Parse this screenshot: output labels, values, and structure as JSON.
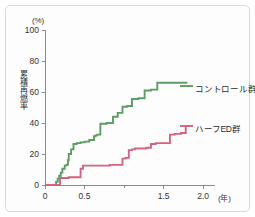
{
  "chart_data": {
    "type": "line",
    "title": "",
    "subtitle": "",
    "xlabel": "(年)",
    "ylabel": "累積再燃率",
    "yunit": "(%)",
    "xlim": [
      0,
      2.15
    ],
    "ylim": [
      0,
      100
    ],
    "grid": false,
    "step_style": "step-after",
    "legend_position": "right-inline",
    "x_ticks": [
      {
        "value": 0,
        "label": "0"
      },
      {
        "value": 0.5,
        "label": "0.5"
      },
      {
        "value": 1.0,
        "label": ""
      },
      {
        "value": 1.5,
        "label": "1.5"
      },
      {
        "value": 2.0,
        "label": "2.0"
      }
    ],
    "y_ticks": [
      {
        "value": 0,
        "label": "0"
      },
      {
        "value": 20,
        "label": "20"
      },
      {
        "value": 40,
        "label": "40"
      },
      {
        "value": 60,
        "label": "60"
      },
      {
        "value": 80,
        "label": "80"
      },
      {
        "value": 100,
        "label": "100"
      }
    ],
    "series": [
      {
        "name": "コントロール群",
        "color": "#5a9e63",
        "x": [
          0.0,
          0.12,
          0.14,
          0.16,
          0.18,
          0.2,
          0.22,
          0.25,
          0.27,
          0.29,
          0.3,
          0.33,
          0.36,
          0.4,
          0.45,
          0.5,
          0.56,
          0.62,
          0.64,
          0.66,
          0.7,
          0.78,
          0.86,
          0.92,
          0.98,
          1.04,
          1.1,
          1.18,
          1.26,
          1.34,
          1.42,
          1.48,
          1.8
        ],
        "y": [
          0.0,
          0.0,
          2.0,
          4.0,
          6.0,
          8.0,
          10.5,
          12.5,
          13.0,
          16.0,
          20.0,
          23.0,
          26.5,
          27.0,
          27.5,
          28.0,
          29.0,
          31.5,
          32.0,
          32.5,
          39.5,
          40.0,
          44.0,
          46.5,
          50.5,
          51.0,
          55.5,
          56.0,
          61.0,
          61.5,
          66.0,
          66.0,
          66.0
        ]
      },
      {
        "name": "ハーフED群",
        "color": "#d4637f",
        "x": [
          0.0,
          0.17,
          0.19,
          0.28,
          0.3,
          0.42,
          0.45,
          0.48,
          0.78,
          0.82,
          0.94,
          0.98,
          1.02,
          1.06,
          1.1,
          1.14,
          1.2,
          1.28,
          1.34,
          1.4,
          1.52,
          1.58,
          1.64,
          1.72,
          1.78,
          1.82
        ],
        "y": [
          0.0,
          0.0,
          4.5,
          4.5,
          5.0,
          5.0,
          10.5,
          12.5,
          12.5,
          13.0,
          13.0,
          17.0,
          17.5,
          22.5,
          23.0,
          23.5,
          23.5,
          24.0,
          26.5,
          27.0,
          27.0,
          32.5,
          33.0,
          33.5,
          38.0,
          38.0
        ]
      }
    ],
    "annotations": []
  },
  "axes": {
    "y_unit_text": "(%)",
    "x_unit_text": "(年)",
    "y_title_text": "累積再燃率"
  },
  "legend": {
    "items": [
      {
        "label": "コントロール群",
        "color": "#5a9e63"
      },
      {
        "label": "ハーフED群",
        "color": "#d4637f"
      }
    ]
  },
  "colors": {
    "control": "#5a9e63",
    "halfed": "#d4637f",
    "axis": "#8a8a8a",
    "text": "#333333",
    "frame": "#d8d8d8",
    "background": "#ffffff"
  }
}
